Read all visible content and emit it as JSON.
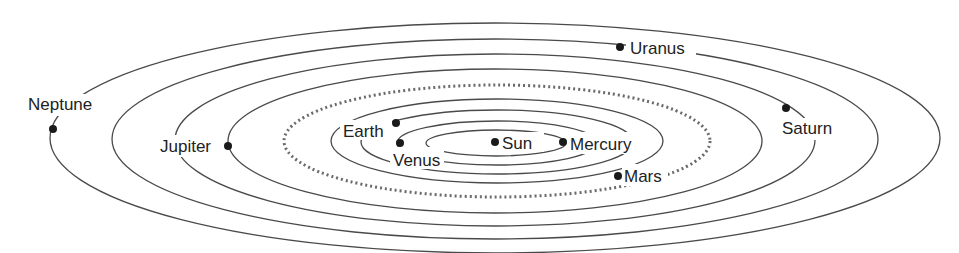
{
  "diagram": {
    "labels": {
      "sun": "Sun",
      "mercury": "Mercury",
      "venus": "Venus",
      "earth": "Earth",
      "mars": "Mars",
      "jupiter": "Jupiter",
      "saturn": "Saturn",
      "uranus": "Uranus",
      "neptune": "Neptune"
    },
    "colors": {
      "orbit": "#4a4a4a",
      "planet": "#1a1a1a",
      "text": "#222222",
      "background": "#ffffff"
    }
  }
}
